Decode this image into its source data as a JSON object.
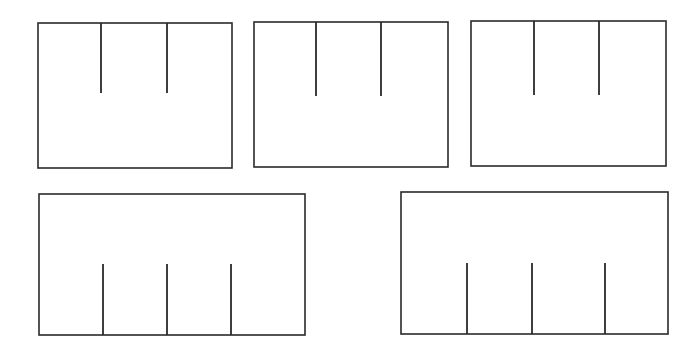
{
  "figure": {
    "background_color": "#ffffff",
    "stroke_color": "#2a2a2a",
    "canvas_width": 699,
    "canvas_height": 353,
    "shape_count": 5,
    "row_counts": [
      3,
      2
    ]
  },
  "chart_data": {
    "type": "diagram",
    "xlabel": "",
    "ylabel": "",
    "grid": false,
    "legend": "none",
    "xlim": [
      0,
      699
    ],
    "ylim": [
      0,
      353
    ],
    "shapes": [
      {
        "id": "frame-1",
        "label": "Top-left frame",
        "row": 1,
        "column": 1,
        "x": 38,
        "y": 23,
        "width": 194,
        "height": 145,
        "tick_direction": "down-from-top",
        "tick_count": 2,
        "ticks": [
          {
            "x": 101,
            "y_start": 23,
            "y_end": 93,
            "length": 70
          },
          {
            "x": 167,
            "y_start": 23,
            "y_end": 93,
            "length": 70
          }
        ]
      },
      {
        "id": "frame-2",
        "label": "Top-center frame",
        "row": 1,
        "column": 2,
        "x": 254,
        "y": 22,
        "width": 194,
        "height": 145,
        "tick_direction": "down-from-top",
        "tick_count": 2,
        "ticks": [
          {
            "x": 316,
            "y_start": 22,
            "y_end": 96,
            "length": 74
          },
          {
            "x": 381,
            "y_start": 22,
            "y_end": 96,
            "length": 74
          }
        ]
      },
      {
        "id": "frame-3",
        "label": "Top-right frame",
        "row": 1,
        "column": 3,
        "x": 471,
        "y": 21,
        "width": 195,
        "height": 145,
        "tick_direction": "down-from-top",
        "tick_count": 2,
        "ticks": [
          {
            "x": 534,
            "y_start": 21,
            "y_end": 95,
            "length": 74
          },
          {
            "x": 599,
            "y_start": 21,
            "y_end": 95,
            "length": 74
          }
        ]
      },
      {
        "id": "frame-4",
        "label": "Bottom-left frame",
        "row": 2,
        "column": 1,
        "x": 39,
        "y": 194,
        "width": 266,
        "height": 141,
        "tick_direction": "up-from-bottom",
        "tick_count": 3,
        "ticks": [
          {
            "x": 103,
            "y_start": 335,
            "y_end": 264,
            "length": 71
          },
          {
            "x": 167,
            "y_start": 335,
            "y_end": 264,
            "length": 71
          },
          {
            "x": 231,
            "y_start": 335,
            "y_end": 264,
            "length": 71
          }
        ]
      },
      {
        "id": "frame-5",
        "label": "Bottom-right frame",
        "row": 2,
        "column": 2,
        "x": 401,
        "y": 192,
        "width": 267,
        "height": 142,
        "tick_direction": "up-from-bottom",
        "tick_count": 3,
        "ticks": [
          {
            "x": 467,
            "y_start": 334,
            "y_end": 263,
            "length": 71
          },
          {
            "x": 532,
            "y_start": 334,
            "y_end": 263,
            "length": 71
          },
          {
            "x": 605,
            "y_start": 334,
            "y_end": 263,
            "length": 71
          }
        ]
      }
    ]
  }
}
